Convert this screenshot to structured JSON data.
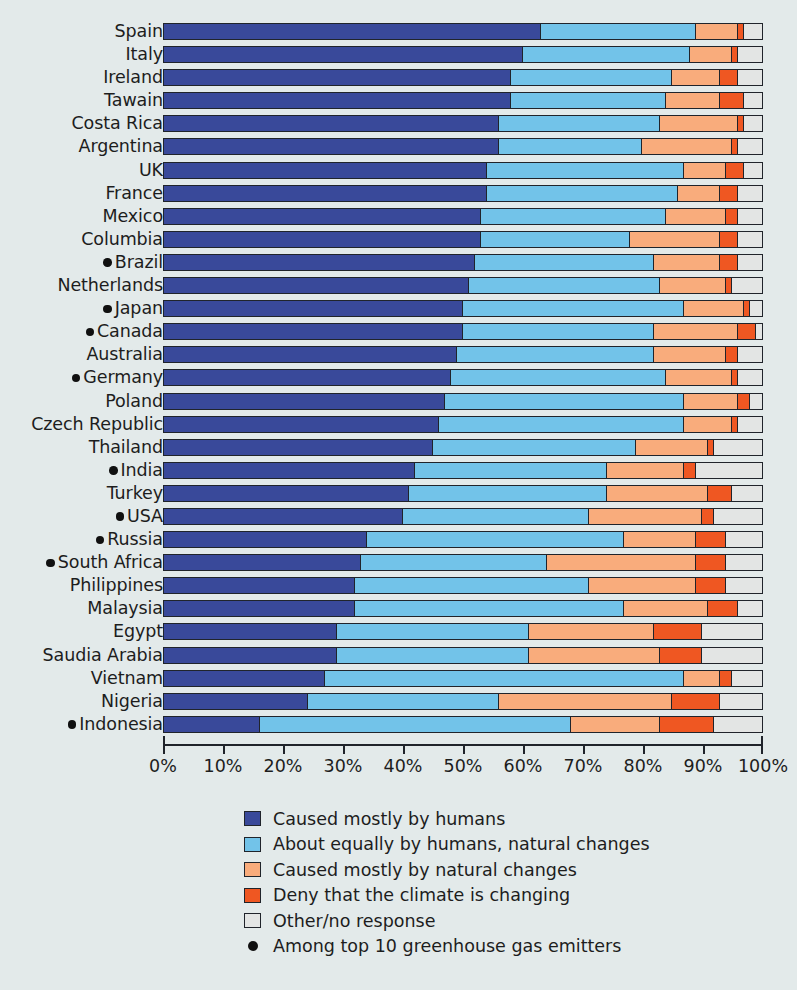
{
  "chart_data": {
    "type": "bar",
    "subtype": "horizontal-stacked-100",
    "title": "",
    "xlabel": "",
    "ylabel": "",
    "xlim": [
      0,
      100
    ],
    "grid": false,
    "legend_position": "bottom",
    "axis_ticks": [
      "0%",
      "10%",
      "20%",
      "30%",
      "40%",
      "50%",
      "60%",
      "70%",
      "80%",
      "90%",
      "100%"
    ],
    "series": [
      {
        "name": "Caused mostly by humans",
        "color": "#39499a"
      },
      {
        "name": "About equally by humans, natural changes",
        "color": "#72c3e9"
      },
      {
        "name": "Caused mostly by natural changes",
        "color": "#f9ac7c"
      },
      {
        "name": "Deny that the climate is changing",
        "color": "#ef5722"
      },
      {
        "name": "Other/no response",
        "color": "#e3e5e4"
      }
    ],
    "categories": [
      "Spain",
      "Italy",
      "Ireland",
      "Tawain",
      "Costa Rica",
      "Argentina",
      "UK",
      "France",
      "Mexico",
      "Columbia",
      "Brazil",
      "Netherlands",
      "Japan",
      "Canada",
      "Australia",
      "Germany",
      "Poland",
      "Czech Republic",
      "Thailand",
      "India",
      "Turkey",
      "USA",
      "Russia",
      "South Africa",
      "Philippines",
      "Malaysia",
      "Egypt",
      "Saudia Arabia",
      "Vietnam",
      "Nigeria",
      "Indonesia"
    ],
    "rows": [
      {
        "label": "Spain",
        "emitter": false,
        "values": [
          63,
          26,
          7,
          1,
          3
        ]
      },
      {
        "label": "Italy",
        "emitter": false,
        "values": [
          60,
          28,
          7,
          1,
          4
        ]
      },
      {
        "label": "Ireland",
        "emitter": false,
        "values": [
          58,
          27,
          8,
          3,
          4
        ]
      },
      {
        "label": "Tawain",
        "emitter": false,
        "values": [
          58,
          26,
          9,
          4,
          3
        ]
      },
      {
        "label": "Costa Rica",
        "emitter": false,
        "values": [
          56,
          27,
          13,
          1,
          3
        ]
      },
      {
        "label": "Argentina",
        "emitter": false,
        "values": [
          56,
          24,
          15,
          1,
          4
        ]
      },
      {
        "label": "UK",
        "emitter": false,
        "values": [
          54,
          33,
          7,
          3,
          3
        ]
      },
      {
        "label": "France",
        "emitter": false,
        "values": [
          54,
          32,
          7,
          3,
          4
        ]
      },
      {
        "label": "Mexico",
        "emitter": false,
        "values": [
          53,
          31,
          10,
          2,
          4
        ]
      },
      {
        "label": "Columbia",
        "emitter": false,
        "values": [
          53,
          25,
          15,
          3,
          4
        ]
      },
      {
        "label": "Brazil",
        "emitter": true,
        "values": [
          52,
          30,
          11,
          3,
          4
        ]
      },
      {
        "label": "Netherlands",
        "emitter": false,
        "values": [
          51,
          32,
          11,
          1,
          5
        ]
      },
      {
        "label": "Japan",
        "emitter": true,
        "values": [
          50,
          37,
          10,
          1,
          2
        ]
      },
      {
        "label": "Canada",
        "emitter": true,
        "values": [
          50,
          32,
          14,
          3,
          1
        ]
      },
      {
        "label": "Australia",
        "emitter": false,
        "values": [
          49,
          33,
          12,
          2,
          4
        ]
      },
      {
        "label": "Germany",
        "emitter": true,
        "values": [
          48,
          36,
          11,
          1,
          4
        ]
      },
      {
        "label": "Poland",
        "emitter": false,
        "values": [
          47,
          40,
          9,
          2,
          2
        ]
      },
      {
        "label": "Czech Republic",
        "emitter": false,
        "values": [
          46,
          41,
          8,
          1,
          4
        ]
      },
      {
        "label": "Thailand",
        "emitter": false,
        "values": [
          45,
          34,
          12,
          1,
          8
        ]
      },
      {
        "label": "India",
        "emitter": true,
        "values": [
          42,
          32,
          13,
          2,
          11
        ]
      },
      {
        "label": "Turkey",
        "emitter": false,
        "values": [
          41,
          33,
          17,
          4,
          5
        ]
      },
      {
        "label": "USA",
        "emitter": true,
        "values": [
          40,
          31,
          19,
          2,
          8
        ]
      },
      {
        "label": "Russia",
        "emitter": true,
        "values": [
          34,
          43,
          12,
          5,
          6
        ]
      },
      {
        "label": "South Africa",
        "emitter": true,
        "values": [
          33,
          31,
          25,
          5,
          6
        ]
      },
      {
        "label": "Philippines",
        "emitter": false,
        "values": [
          32,
          39,
          18,
          5,
          6
        ]
      },
      {
        "label": "Malaysia",
        "emitter": false,
        "values": [
          32,
          45,
          14,
          5,
          4
        ]
      },
      {
        "label": "Egypt",
        "emitter": false,
        "values": [
          29,
          32,
          21,
          8,
          10
        ]
      },
      {
        "label": "Saudia Arabia",
        "emitter": false,
        "values": [
          29,
          32,
          22,
          7,
          10
        ]
      },
      {
        "label": "Vietnam",
        "emitter": false,
        "values": [
          27,
          60,
          6,
          2,
          5
        ]
      },
      {
        "label": "Nigeria",
        "emitter": false,
        "values": [
          24,
          32,
          29,
          8,
          7
        ]
      },
      {
        "label": "Indonesia",
        "emitter": true,
        "values": [
          16,
          52,
          15,
          9,
          8
        ]
      }
    ]
  },
  "axis": {
    "ticks": [
      {
        "label": "0%",
        "pct": 0
      },
      {
        "label": "10%",
        "pct": 10
      },
      {
        "label": "20%",
        "pct": 20
      },
      {
        "label": "30%",
        "pct": 30
      },
      {
        "label": "40%",
        "pct": 40
      },
      {
        "label": "50%",
        "pct": 50
      },
      {
        "label": "60%",
        "pct": 60
      },
      {
        "label": "70%",
        "pct": 70
      },
      {
        "label": "80%",
        "pct": 80
      },
      {
        "label": "90%",
        "pct": 90
      },
      {
        "label": "100%",
        "pct": 100
      }
    ]
  },
  "legend": {
    "items": [
      {
        "swatch": "s0",
        "label": "Caused mostly by humans",
        "kind": "box"
      },
      {
        "swatch": "s1",
        "label": "About equally by humans, natural changes",
        "kind": "box"
      },
      {
        "swatch": "s2",
        "label": "Caused mostly by natural changes",
        "kind": "box"
      },
      {
        "swatch": "s3",
        "label": "Deny that the climate is changing",
        "kind": "box"
      },
      {
        "swatch": "s4",
        "label": "Other/no response",
        "kind": "box"
      },
      {
        "swatch": "dot",
        "label": "Among top 10 greenhouse gas emitters",
        "kind": "dot"
      }
    ]
  },
  "colors": {
    "background": "#e3eaea",
    "ink": "#20242b",
    "humans": "#39499a",
    "equally": "#72c3e9",
    "natural": "#f9ac7c",
    "deny": "#ef5722",
    "other": "#e3e5e4"
  }
}
